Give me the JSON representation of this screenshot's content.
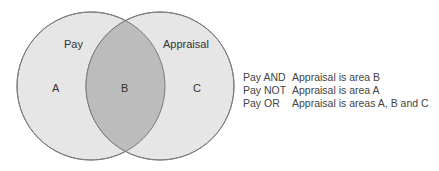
{
  "diagram": {
    "type": "venn",
    "sets": [
      {
        "name": "Pay",
        "region": "A"
      },
      {
        "name": "Appraisal",
        "region": "C"
      }
    ],
    "intersection_region": "B",
    "colors": {
      "circle_fill": "#e6e6e6",
      "intersection_fill": "#bcbcbc",
      "stroke": "#7a7a7a"
    }
  },
  "labels": {
    "set_left": "Pay",
    "set_right": "Appraisal",
    "region_a": "A",
    "region_b": "B",
    "region_c": "C"
  },
  "legend": [
    {
      "op": "Pay AND",
      "desc": "Appraisal is area B"
    },
    {
      "op": "Pay NOT",
      "desc": "Appraisal is area A"
    },
    {
      "op": "Pay OR",
      "desc": "Appraisal is areas A, B and C"
    }
  ]
}
